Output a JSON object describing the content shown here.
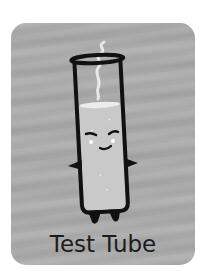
{
  "card": {
    "title": "Test Tube",
    "background_color": "#ababab",
    "text_color": "#1c1c1c"
  },
  "illustration": {
    "subject": "test-tube-character",
    "features": [
      "steam",
      "liquid",
      "eyes",
      "smile",
      "arms",
      "feet"
    ]
  }
}
